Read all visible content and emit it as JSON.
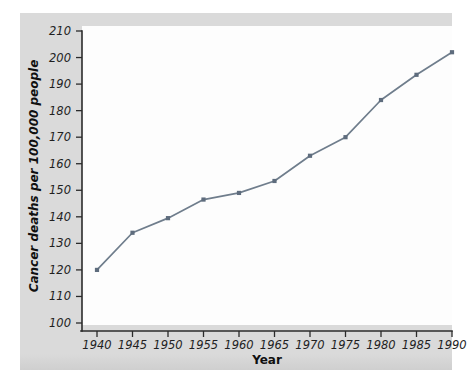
{
  "chart_data": {
    "type": "line",
    "title": "",
    "xlabel": "Year",
    "ylabel": "Cancer deaths per 100,000 people",
    "x": [
      1940,
      1945,
      1950,
      1955,
      1960,
      1965,
      1970,
      1975,
      1980,
      1985,
      1990
    ],
    "values": [
      120,
      134,
      139.5,
      146.5,
      149,
      153.5,
      163,
      170,
      184,
      193.5,
      202
    ],
    "xtick_labels": [
      "1940",
      "1945",
      "1950",
      "1955",
      "1960",
      "1965",
      "1970",
      "1975",
      "1980",
      "1985",
      "1990"
    ],
    "ytick_labels": [
      "100",
      "110",
      "120",
      "130",
      "140",
      "150",
      "160",
      "170",
      "180",
      "190",
      "200",
      "210"
    ],
    "yticks": [
      100,
      110,
      120,
      130,
      140,
      150,
      160,
      170,
      180,
      190,
      200,
      210
    ],
    "xlim": [
      1938,
      1992
    ],
    "ylim": [
      100,
      210
    ],
    "grid": false,
    "legend": false,
    "series": [
      {
        "name": "Cancer deaths per 100,000 people",
        "values": [
          120,
          134,
          139.5,
          146.5,
          149,
          153.5,
          163,
          170,
          184,
          193.5,
          202
        ]
      }
    ],
    "colors": {
      "line": "#6f7d8c",
      "marker": "#5e6c7d",
      "figure_background": "#dadada",
      "plot_background": "#fdfdfd",
      "axis": "#2b2b2b",
      "text": "#1f1f1f"
    }
  }
}
